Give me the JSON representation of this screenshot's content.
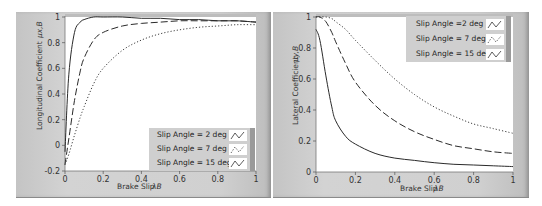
{
  "chart_data": [
    {
      "type": "line",
      "id": "longitudinal",
      "title": "",
      "xlabel": "Brake Slip λB",
      "ylabel": "Longitudinal Coefficient μx,B",
      "xlim": [
        0,
        1
      ],
      "ylim": [
        -0.2,
        1
      ],
      "xticks": [
        "0",
        "0.2",
        "0.4",
        "0.6",
        "0.8",
        "1"
      ],
      "yticks": [
        "-0.2",
        "0",
        "0.2",
        "0.4",
        "0.6",
        "0.8",
        "1"
      ],
      "grid": false,
      "legend_position": "lower right",
      "x": [
        0,
        0.02,
        0.05,
        0.08,
        0.1,
        0.15,
        0.2,
        0.3,
        0.4,
        0.5,
        0.6,
        0.7,
        0.8,
        0.9,
        1.0
      ],
      "series": [
        {
          "name": "Slip Angle = 2 deg",
          "style": "solid",
          "values": [
            -0.05,
            0.55,
            0.88,
            0.96,
            0.98,
            1.0,
            1.0,
            1.0,
            0.99,
            0.99,
            0.98,
            0.98,
            0.97,
            0.97,
            0.96
          ]
        },
        {
          "name": "Slip Angle = 7 deg",
          "style": "dashed",
          "values": [
            -0.15,
            0.05,
            0.35,
            0.58,
            0.68,
            0.82,
            0.88,
            0.93,
            0.95,
            0.96,
            0.97,
            0.97,
            0.97,
            0.97,
            0.96
          ]
        },
        {
          "name": "Slip Angle = 15 deg",
          "style": "dotted",
          "values": [
            -0.15,
            -0.07,
            0.08,
            0.22,
            0.3,
            0.48,
            0.6,
            0.74,
            0.82,
            0.87,
            0.9,
            0.92,
            0.93,
            0.94,
            0.94
          ]
        }
      ]
    },
    {
      "type": "line",
      "id": "lateral",
      "title": "",
      "xlabel": "Brake Slip λB",
      "ylabel": "Lateral Coefficient μy,B",
      "xlim": [
        0,
        1
      ],
      "ylim": [
        0,
        1
      ],
      "xticks": [
        "0",
        "0.2",
        "0.4",
        "0.6",
        "0.8",
        "1"
      ],
      "yticks": [
        "0",
        "0.2",
        "0.4",
        "0.6",
        "0.8",
        "1"
      ],
      "grid": false,
      "legend_position": "upper right",
      "x": [
        0,
        0.02,
        0.05,
        0.08,
        0.1,
        0.15,
        0.2,
        0.3,
        0.4,
        0.5,
        0.6,
        0.7,
        0.8,
        0.9,
        1.0
      ],
      "series": [
        {
          "name": "Slip Angle =2 deg",
          "style": "solid",
          "values": [
            0.92,
            0.85,
            0.62,
            0.42,
            0.33,
            0.23,
            0.18,
            0.12,
            0.09,
            0.075,
            0.06,
            0.05,
            0.045,
            0.04,
            0.035
          ]
        },
        {
          "name": "Slip Angle = 7 deg",
          "style": "dashed",
          "values": [
            1.0,
            1.0,
            0.97,
            0.9,
            0.84,
            0.7,
            0.58,
            0.43,
            0.33,
            0.26,
            0.21,
            0.17,
            0.15,
            0.13,
            0.12
          ]
        },
        {
          "name": "Slip Angle = 15 deg",
          "style": "dotted",
          "values": [
            1.0,
            1.0,
            1.0,
            0.99,
            0.97,
            0.92,
            0.85,
            0.72,
            0.6,
            0.5,
            0.42,
            0.36,
            0.31,
            0.28,
            0.25
          ]
        }
      ]
    }
  ],
  "left": {
    "ylabel_text": "Longitudinal Coefficient",
    "ylabel_symbol": "μx,B",
    "xlabel_text": "Brake Slip",
    "xlabel_symbol": "λB",
    "legend": [
      "Slip Angle = 2 deg",
      "Slip Angle = 7 deg",
      "Slip Angle = 15 deg"
    ]
  },
  "right": {
    "ylabel_text": "Lateral Coefficient",
    "ylabel_symbol": "μy,B",
    "xlabel_text": "Brake Slip",
    "xlabel_symbol": "λB",
    "legend": [
      "Slip Angle =2 deg",
      "Slip Angle = 7 deg",
      "Slip Angle = 15 deg"
    ]
  }
}
